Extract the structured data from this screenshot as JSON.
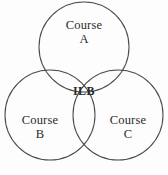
{
  "diagram": {
    "type": "venn-3-set",
    "canvas": {
      "width": 168,
      "height": 175
    },
    "background_color": "#fdfdfd",
    "stroke_color": "#4a4a4a",
    "text_color": "#2b2b2b",
    "circles": [
      {
        "id": "A",
        "cx": 84,
        "cy": 47,
        "r": 45
      },
      {
        "id": "B",
        "cx": 50,
        "cy": 115,
        "r": 45
      },
      {
        "id": "C",
        "cx": 118,
        "cy": 115,
        "r": 45
      }
    ],
    "labels": {
      "set_a": {
        "line1": "Course",
        "line2": "A"
      },
      "set_b": {
        "line1": "Course",
        "line2": "B"
      },
      "set_c": {
        "line1": "Course",
        "line2": "C"
      },
      "intersection": "ILB"
    }
  }
}
